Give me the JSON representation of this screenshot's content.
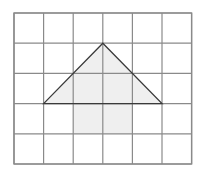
{
  "figure": {
    "background_color": "#ffffff",
    "grid": {
      "columns": 6,
      "rows": 5,
      "origin_x": 14,
      "origin_y": 13,
      "cell_width": 29.6,
      "cell_height": 30.2,
      "line_color": "#8a8a8a",
      "line_width": 1.2,
      "border_color": "#8a8a8a",
      "border_width": 1.4,
      "x_lines": [
        14,
        43.6,
        73.2,
        102.8,
        132.4,
        162,
        191.6
      ],
      "y_lines": [
        13,
        43.2,
        73.4,
        103.6,
        133.8,
        164
      ]
    },
    "shapes": [
      {
        "name": "triangle-roof",
        "type": "polygon",
        "fill_color": "#efefef",
        "stroke_color": "#3a3a3a",
        "stroke_width": 1.3,
        "grid_points": [
          [
            1,
            3
          ],
          [
            3,
            1
          ],
          [
            5,
            3
          ]
        ],
        "points": "43.6,103.6 102.8,43.2 162,103.6",
        "label": "triangle"
      },
      {
        "name": "rectangle-body",
        "type": "rect",
        "fill_color": "#efefef",
        "stroke_color": "none",
        "grid_points": [
          [
            2,
            3
          ],
          [
            4,
            3
          ],
          [
            4,
            4
          ],
          [
            2,
            4
          ]
        ],
        "x": 73.2,
        "y": 103.6,
        "width": 59.2,
        "height": 30.2,
        "label": "rectangle"
      }
    ]
  }
}
